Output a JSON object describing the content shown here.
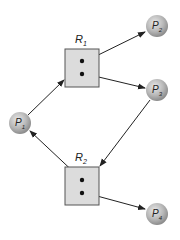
{
  "diagram": {
    "type": "resource-allocation-graph",
    "processes": [
      {
        "id": "P1",
        "name": "P",
        "sub": "1",
        "cx": 20,
        "cy": 123
      },
      {
        "id": "P2",
        "name": "P",
        "sub": "2",
        "cx": 157,
        "cy": 26
      },
      {
        "id": "P3",
        "name": "P",
        "sub": "3",
        "cx": 157,
        "cy": 90
      },
      {
        "id": "P4",
        "name": "P",
        "sub": "4",
        "cx": 157,
        "cy": 214
      }
    ],
    "resources": [
      {
        "id": "R1",
        "name": "R",
        "sub": "1",
        "instances": 2
      },
      {
        "id": "R2",
        "name": "R",
        "sub": "2",
        "instances": 2
      }
    ],
    "edges": [
      {
        "from": "P1",
        "to": "R1",
        "kind": "request"
      },
      {
        "from": "R1",
        "to": "P2",
        "kind": "assignment"
      },
      {
        "from": "R1",
        "to": "P3",
        "kind": "assignment"
      },
      {
        "from": "P3",
        "to": "R2",
        "kind": "request"
      },
      {
        "from": "R2",
        "to": "P1",
        "kind": "assignment"
      },
      {
        "from": "R2",
        "to": "P4",
        "kind": "assignment"
      }
    ],
    "colors": {
      "process_fill": "#b8b8b8",
      "resource_fill": "#dcdcdc",
      "edge": "#222222"
    }
  }
}
